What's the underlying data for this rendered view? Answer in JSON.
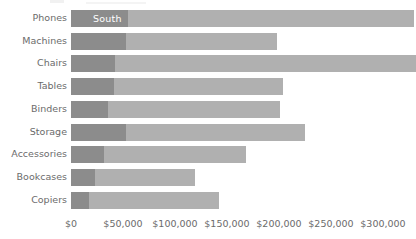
{
  "chart_data": {
    "type": "bar",
    "orientation": "horizontal",
    "stacked": true,
    "title": "",
    "subtitle": "",
    "xlabel": "",
    "ylabel": "",
    "grid": false,
    "legend_position": "none",
    "annotations": [
      "South"
    ],
    "xlim": [
      0,
      330000
    ],
    "axis": {
      "tick_values": [
        0,
        50000,
        100000,
        150000,
        200000,
        250000,
        300000
      ],
      "tick_labels": [
        "$0",
        "$50,000",
        "$100,000",
        "$150,000",
        "$200,000",
        "$250,000",
        "$300,000"
      ]
    },
    "categories": [
      "Phones",
      "Machines",
      "Chairs",
      "Tables",
      "Binders",
      "Storage",
      "Accessories",
      "Bookcases",
      "Copiers"
    ],
    "series": [
      {
        "name": "South",
        "color": "#8c8c8c",
        "values": [
          55000,
          53000,
          42000,
          41000,
          36000,
          53000,
          32000,
          23000,
          17000
        ]
      },
      {
        "name": "Other regions",
        "color": "#b0b0b0",
        "values": [
          275000,
          145000,
          290000,
          163000,
          165000,
          172000,
          136000,
          96000,
          125000
        ]
      }
    ],
    "totals": [
      330000,
      198000,
      332000,
      204000,
      201000,
      225000,
      168000,
      119000,
      142000
    ]
  },
  "colors": {
    "south": "#8c8c8c",
    "other": "#b0b0b0",
    "text": "#6b6b6b",
    "label_on_bar": "#ffffff",
    "background": "#ffffff"
  },
  "labels": {
    "segment_callout": "South"
  }
}
